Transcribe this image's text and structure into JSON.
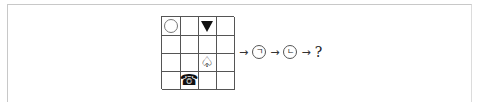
{
  "grid": {
    "rows": 4,
    "cols": 4,
    "cells": [
      [
        "circle",
        "",
        "filled-down-triangle",
        ""
      ],
      [
        "",
        "",
        "",
        ""
      ],
      [
        "",
        "",
        "outlined-spade",
        ""
      ],
      [
        "",
        "telephone",
        "",
        ""
      ]
    ],
    "glyphs": {
      "outlined-spade": "♤",
      "telephone": "☎"
    }
  },
  "sequence": {
    "items": [
      {
        "type": "arrow",
        "text": "→"
      },
      {
        "type": "circled",
        "text": "ㄱ"
      },
      {
        "type": "arrow",
        "text": "→"
      },
      {
        "type": "circled",
        "text": "ㄴ"
      },
      {
        "type": "arrow",
        "text": "→"
      },
      {
        "type": "question",
        "text": "?"
      }
    ]
  },
  "colors": {
    "grid_line": "#555555",
    "frame_line": "#c8c8c8",
    "ink": "#111111"
  }
}
